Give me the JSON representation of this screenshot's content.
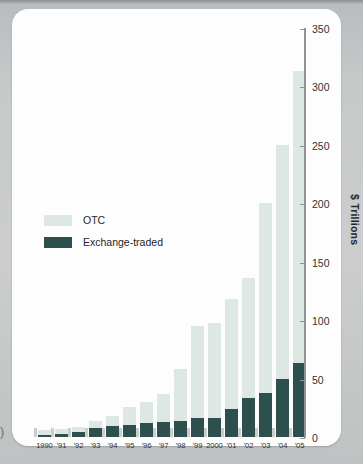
{
  "chart_data": {
    "type": "bar",
    "title": "",
    "subtitle": "",
    "xlabel": "",
    "ylabel": "$ Trillions",
    "ylim": [
      0,
      350
    ],
    "yticks": [
      0,
      50,
      100,
      150,
      200,
      250,
      300,
      350
    ],
    "grid": false,
    "stacked": true,
    "legend_position": "inside-left",
    "categories": [
      "1990",
      "'91",
      "'92",
      "'93",
      "'94",
      "'95",
      "'96",
      "'97",
      "'98",
      "'99",
      "2000",
      "'01",
      "'02",
      "'03",
      "'04",
      "'05"
    ],
    "series": [
      {
        "name": "Exchange-traded",
        "color": "#2d4f4d",
        "values": [
          2,
          3,
          4,
          8,
          9,
          10,
          12,
          13,
          14,
          16,
          16,
          24,
          33,
          38,
          50,
          63
        ]
      },
      {
        "name": "OTC",
        "color": "#dde7e3",
        "values": [
          4,
          4,
          5,
          6,
          9,
          16,
          18,
          24,
          44,
          79,
          82,
          94,
          103,
          162,
          200,
          250
        ]
      }
    ],
    "totals": [
      6,
      7,
      9,
      14,
      18,
      26,
      30,
      37,
      58,
      95,
      98,
      118,
      136,
      200,
      250,
      313
    ]
  },
  "axes": {
    "y_title": "$ Trillions",
    "y_tick_labels": [
      "350",
      "300",
      "250",
      "200",
      "150",
      "100",
      "50",
      "0"
    ],
    "x_tick_labels": [
      "1990",
      "'91",
      "'92",
      "'93",
      "'94",
      "'95",
      "'96",
      "'97",
      "'98",
      "'99",
      "2000",
      "'01",
      "'02",
      "'03",
      "'04",
      "'05"
    ]
  },
  "legend": {
    "items": [
      {
        "label": "OTC",
        "color": "#dde7e3"
      },
      {
        "label": "Exchange-traded",
        "color": "#2d4f4d"
      }
    ]
  },
  "page": {
    "margin_marker": ")"
  },
  "colors": {
    "otc": "#dde7e3",
    "exchange_traded": "#2d4f4d",
    "axis": "#8f9495",
    "text": "#23282a",
    "card": "#fdfdfd",
    "page_background": "#c6c9ca"
  }
}
